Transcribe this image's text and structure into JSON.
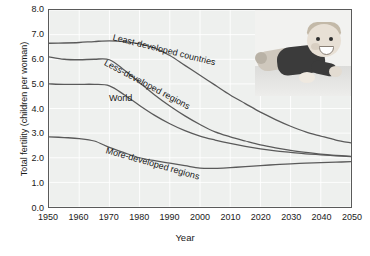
{
  "chart_data": {
    "type": "line",
    "title": "",
    "xlabel": "Year",
    "ylabel": "Total fertility (children per woman)",
    "xlim": [
      1950,
      2050
    ],
    "ylim": [
      0.0,
      8.0
    ],
    "grid": true,
    "legend_position": "inline-labels",
    "xticks": [
      "1950",
      "1960",
      "1970",
      "1980",
      "1990",
      "2000",
      "2010",
      "2020",
      "2030",
      "2040",
      "2050"
    ],
    "yticks": [
      "0.0",
      "1.0",
      "2.0",
      "3.0",
      "4.0",
      "5.0",
      "6.0",
      "7.0",
      "8.0"
    ],
    "x": [
      1950,
      1955,
      1960,
      1965,
      1970,
      1975,
      1980,
      1985,
      1990,
      1995,
      2000,
      2005,
      2010,
      2015,
      2020,
      2025,
      2030,
      2035,
      2040,
      2045,
      2050
    ],
    "series": [
      {
        "name": "Least-developed countries",
        "color": "#5a5a5a",
        "values": [
          6.65,
          6.66,
          6.68,
          6.72,
          6.75,
          6.72,
          6.62,
          6.45,
          6.15,
          5.75,
          5.35,
          4.95,
          4.55,
          4.2,
          3.85,
          3.55,
          3.28,
          3.05,
          2.88,
          2.72,
          2.6
        ]
      },
      {
        "name": "Less-developed regions",
        "color": "#5a5a5a",
        "values": [
          6.1,
          6.0,
          5.98,
          6.0,
          5.98,
          5.55,
          5.05,
          4.55,
          4.1,
          3.7,
          3.35,
          3.05,
          2.85,
          2.68,
          2.52,
          2.4,
          2.3,
          2.22,
          2.15,
          2.1,
          2.06
        ]
      },
      {
        "name": "World",
        "color": "#5a5a5a",
        "values": [
          5.0,
          4.98,
          4.98,
          4.98,
          4.92,
          4.55,
          4.12,
          3.72,
          3.38,
          3.1,
          2.88,
          2.72,
          2.58,
          2.46,
          2.36,
          2.28,
          2.22,
          2.16,
          2.12,
          2.08,
          2.05
        ]
      },
      {
        "name": "More-developed regions",
        "color": "#5a5a5a",
        "values": [
          2.85,
          2.82,
          2.78,
          2.68,
          2.42,
          2.2,
          2.0,
          1.88,
          1.78,
          1.68,
          1.58,
          1.57,
          1.6,
          1.64,
          1.68,
          1.72,
          1.75,
          1.78,
          1.8,
          1.82,
          1.84
        ]
      }
    ],
    "series_labels": [
      {
        "text": "Least-developed countries",
        "x": 64,
        "y": 22,
        "rotate": 14
      },
      {
        "text": "Less-developed regions",
        "x": 56,
        "y": 47,
        "rotate": 28
      },
      {
        "text": "World",
        "x": 60,
        "y": 83,
        "rotate": 0
      },
      {
        "text": "More-developed regions",
        "x": 57,
        "y": 135,
        "rotate": 16
      }
    ],
    "photo": {
      "alt": "smiling baby lying on stomach"
    }
  }
}
